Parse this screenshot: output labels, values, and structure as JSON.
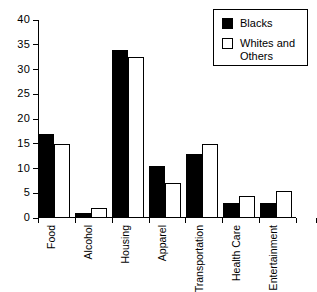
{
  "chart_data": {
    "type": "bar",
    "title": "",
    "xlabel": "",
    "ylabel": "",
    "ylim": [
      0,
      40
    ],
    "yticks": [
      0,
      5,
      10,
      15,
      20,
      25,
      30,
      35,
      40
    ],
    "grid": false,
    "legend_position": "top-right",
    "categories": [
      "Food",
      "Alcohol",
      "Housing",
      "Apparel",
      "Transportation",
      "Health Care",
      "Entertainment"
    ],
    "series": [
      {
        "name": "Blacks",
        "color": "#000000",
        "style": "filled",
        "values": [
          17,
          1,
          34,
          10.5,
          13,
          3,
          3
        ]
      },
      {
        "name": "Whites and Others",
        "color": "#ffffff",
        "style": "outlined",
        "values": [
          15,
          2,
          32.5,
          7,
          15,
          4.5,
          5.5
        ]
      }
    ]
  },
  "legend": {
    "items": [
      {
        "label": "Blacks",
        "swatch": "black-square-swatch"
      },
      {
        "label": "Whites and Others",
        "swatch": "white-square-swatch"
      }
    ]
  },
  "axis": {
    "y_tick_labels": [
      "0",
      "5",
      "10",
      "15",
      "20",
      "25",
      "30",
      "35",
      "40"
    ],
    "x_tick_labels": [
      "Food",
      "Alcohol",
      "Housing",
      "Apparel",
      "Transportation",
      "Health Care",
      "Entertainment"
    ]
  }
}
